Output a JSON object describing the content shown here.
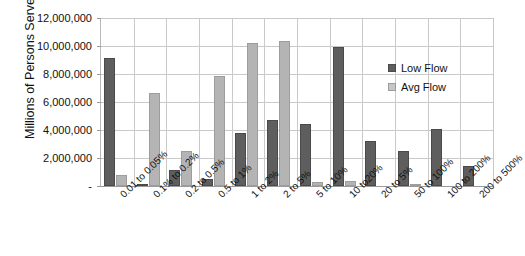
{
  "chart_data": {
    "type": "bar",
    "title": "",
    "xlabel": "",
    "ylabel": "Millions of Persons Served",
    "ylim": [
      0,
      12000000
    ],
    "ytick_step": 2000000,
    "ytick_labels": [
      "12,000,000",
      "10,000,000",
      "8,000,000",
      "6,000,000",
      "4,000,000",
      "2,000,000",
      "-"
    ],
    "ytick_values": [
      12000000,
      10000000,
      8000000,
      6000000,
      4000000,
      2000000,
      0
    ],
    "grid": true,
    "legend_position": "inside-right-top",
    "categories": [
      "0.01 to 0.05%",
      "0.1% to 0.2%",
      "0.2 to 0.5%",
      "0.5 to 1%",
      "1 to 2%",
      "2 to 5%",
      "5 to 10%",
      "10 to20%",
      "20 to 5%",
      "50 to 100%",
      "100 to 200%",
      "200 to 500%"
    ],
    "series": [
      {
        "name": "Low Flow",
        "color": "#5e5e5e",
        "values": [
          9150000,
          60000,
          1150000,
          480000,
          3800000,
          4700000,
          4450000,
          9950000,
          3200000,
          2480000,
          4100000,
          1400000
        ]
      },
      {
        "name": "Avg Flow",
        "color": "#b4b4b4",
        "values": [
          790000,
          6650000,
          2530000,
          7880000,
          10250000,
          10350000,
          300000,
          330000,
          0,
          100000,
          0,
          0
        ]
      }
    ]
  },
  "legend": {
    "items": [
      {
        "label": "Low Flow"
      },
      {
        "label": "Avg Flow"
      }
    ]
  }
}
